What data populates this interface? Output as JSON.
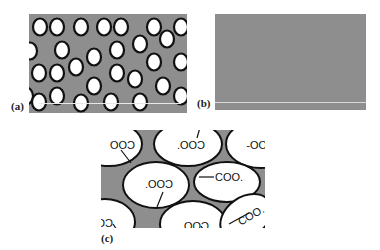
{
  "figure": {
    "panels": [
      {
        "id": "a",
        "label": "(a)",
        "description": "Gray matrix with dispersed white circular particles outlined in black"
      },
      {
        "id": "b",
        "label": "(b)",
        "description": "Uniform gray matrix with no particles"
      },
      {
        "id": "c",
        "label": "(c)",
        "description": "Gray matrix with large white elliptical domains each bearing a COO- group"
      }
    ],
    "group_label": "COO-",
    "group_label_variants": [
      "COO-",
      "-OOC",
      "COO.",
      "'OOC"
    ],
    "colors": {
      "matrix": "#8e8e8e",
      "particle_fill": "#ffffff",
      "particle_outline": "#111111",
      "background": "#ffffff"
    }
  },
  "panel_c_labels": [
    {
      "text": "COO",
      "mirror": true
    },
    {
      "text": "COO.",
      "mirror": true
    },
    {
      "text": "COO-",
      "mirror": true
    },
    {
      "text": "COO.",
      "mirror": true
    },
    {
      "text": "COO.",
      "mirror": false
    },
    {
      "text": "CO",
      "mirror": true
    },
    {
      "text": "COO.",
      "mirror": true
    },
    {
      "text": "COO.",
      "mirror": false
    }
  ]
}
